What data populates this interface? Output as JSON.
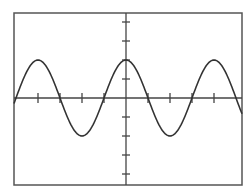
{
  "chart_data": {
    "type": "line",
    "title": "",
    "xlabel": "",
    "ylabel": "",
    "function": "cosine",
    "amplitude_ticks": 2,
    "period_quarter_ticks": 4,
    "x": [
      -2.5,
      -2.25,
      -2.0,
      -1.75,
      -1.5,
      -1.25,
      -1.0,
      -0.75,
      -0.5,
      -0.25,
      0.0,
      0.25,
      0.5,
      0.75,
      1.0,
      1.25,
      1.5,
      1.75,
      2.0,
      2.25,
      2.5
    ],
    "series": [
      {
        "name": "waveform",
        "values": [
          0.0,
          1.41,
          2.0,
          1.41,
          0.0,
          -1.41,
          -2.0,
          -1.41,
          0.0,
          1.41,
          2.0,
          1.41,
          0.0,
          -1.41,
          -2.0,
          -1.41,
          0.0,
          1.41,
          2.0,
          1.41,
          0.0
        ]
      }
    ],
    "x_unit": "periods",
    "ylim": [
      -4,
      4
    ],
    "xlim": [
      -1.3,
      1.3
    ],
    "x_ticks": [
      -1.0,
      -0.75,
      -0.5,
      -0.25,
      0.25,
      0.5,
      0.75,
      1.0
    ],
    "y_ticks": [
      -4,
      -3,
      -2,
      -1,
      1,
      2,
      3,
      4
    ],
    "grid": false,
    "legend": null,
    "colors": {
      "line": "#333333",
      "frame": "#555555",
      "axis": "#444444"
    }
  }
}
